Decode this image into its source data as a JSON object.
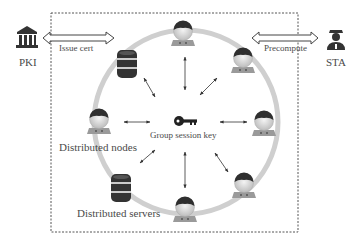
{
  "diagram": {
    "entities": {
      "pki": {
        "label": "PKI",
        "icon": "bank-building-icon"
      },
      "sta": {
        "label": "STA",
        "icon": "police-officer-icon"
      }
    },
    "arrows": {
      "issue_cert": {
        "label": "Issue cert",
        "from": "PKI",
        "to": "Distributed network"
      },
      "precompute": {
        "label": "Precompute",
        "from": "STA",
        "to": "Distributed network"
      }
    },
    "center": {
      "label": "Group session key",
      "icon": "key-icon"
    },
    "labels": {
      "nodes": "Distributed nodes",
      "servers": "Distributed servers"
    },
    "ring_members": [
      {
        "type": "node",
        "position": "top"
      },
      {
        "type": "node",
        "position": "top-right"
      },
      {
        "type": "node",
        "position": "right"
      },
      {
        "type": "node",
        "position": "bottom-right"
      },
      {
        "type": "node",
        "position": "bottom"
      },
      {
        "type": "node",
        "position": "left"
      },
      {
        "type": "server",
        "position": "top-left"
      },
      {
        "type": "server",
        "position": "bottom-left"
      }
    ],
    "colors": {
      "ring": "#cfcfcf",
      "border": "#555555",
      "icon_dark": "#333333",
      "text": "#4a4a4a"
    }
  }
}
